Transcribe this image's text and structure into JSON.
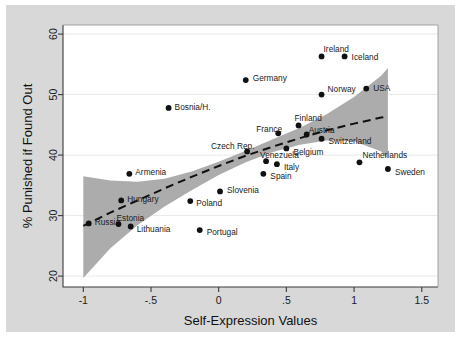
{
  "chart_data": {
    "type": "scatter",
    "title": "",
    "xlabel": "Self-Expression Values",
    "ylabel": "% Punished if Found Out",
    "xlim": [
      -1.15,
      1.62
    ],
    "ylim": [
      18.2,
      61.5
    ],
    "xticks": [
      "-1",
      "-.5",
      "0",
      ".5",
      "1",
      "1.5"
    ],
    "xtick_values": [
      -1,
      -0.5,
      0,
      0.5,
      1,
      1.5
    ],
    "yticks": [
      "20",
      "30",
      "40",
      "50",
      "60"
    ],
    "ytick_values": [
      20,
      30,
      40,
      50,
      60
    ],
    "grid": "horizontal",
    "legend": "none",
    "points": [
      {
        "label": "Russia",
        "x": -0.96,
        "y": 28.7,
        "lx": 6,
        "ly": -1
      },
      {
        "label": "Estonia",
        "x": -0.74,
        "y": 28.6,
        "lx": -2,
        "ly": -6
      },
      {
        "label": "Lithuania",
        "x": -0.65,
        "y": 28.2,
        "lx": 6,
        "ly": 3
      },
      {
        "label": "Hungary",
        "x": -0.72,
        "y": 32.5,
        "lx": 6,
        "ly": -1
      },
      {
        "label": "Armenia",
        "x": -0.66,
        "y": 36.9,
        "lx": 6,
        "ly": -2
      },
      {
        "label": "Bosnia/H.",
        "x": -0.37,
        "y": 47.8,
        "lx": 6,
        "ly": -1
      },
      {
        "label": "Poland",
        "x": -0.21,
        "y": 32.4,
        "lx": 6,
        "ly": 2
      },
      {
        "label": "Portugal",
        "x": -0.14,
        "y": 27.6,
        "lx": 7,
        "ly": 2
      },
      {
        "label": "Slovenia",
        "x": 0.01,
        "y": 34.0,
        "lx": 7,
        "ly": -1
      },
      {
        "label": "Germany",
        "x": 0.2,
        "y": 52.4,
        "lx": 7,
        "ly": -2
      },
      {
        "label": "Czech Rep.",
        "x": 0.21,
        "y": 40.6,
        "lx": -36,
        "ly": -5
      },
      {
        "label": "Spain",
        "x": 0.33,
        "y": 36.9,
        "lx": 7,
        "ly": 2
      },
      {
        "label": "Venezuela",
        "x": 0.35,
        "y": 39.0,
        "lx": -6,
        "ly": -6
      },
      {
        "label": "Italy",
        "x": 0.43,
        "y": 38.5,
        "lx": 7,
        "ly": 3
      },
      {
        "label": "France",
        "x": 0.44,
        "y": 43.6,
        "lx": -22,
        "ly": -4
      },
      {
        "label": "Belgium",
        "x": 0.5,
        "y": 41.1,
        "lx": 7,
        "ly": 4
      },
      {
        "label": "Finland",
        "x": 0.59,
        "y": 44.9,
        "lx": -4,
        "ly": -7
      },
      {
        "label": "Austria",
        "x": 0.65,
        "y": 43.4,
        "lx": 2,
        "ly": -5
      },
      {
        "label": "Switzerland",
        "x": 0.76,
        "y": 42.7,
        "lx": 7,
        "ly": 2
      },
      {
        "label": "Norway",
        "x": 0.76,
        "y": 50.0,
        "lx": 6,
        "ly": -6
      },
      {
        "label": "Ireland",
        "x": 0.76,
        "y": 56.3,
        "lx": 2,
        "ly": -7
      },
      {
        "label": "Iceland",
        "x": 0.93,
        "y": 56.3,
        "lx": 7,
        "ly": 1
      },
      {
        "label": "Netherlands",
        "x": 1.04,
        "y": 38.8,
        "lx": 3,
        "ly": -7
      },
      {
        "label": "USA",
        "x": 1.09,
        "y": 51.0,
        "lx": 7,
        "ly": -1
      },
      {
        "label": "Sweden",
        "x": 1.25,
        "y": 37.7,
        "lx": 7,
        "ly": 3
      }
    ],
    "fit_line": {
      "style": "dashed",
      "x": [
        -1.0,
        -0.8,
        -0.6,
        -0.4,
        -0.2,
        0.0,
        0.2,
        0.4,
        0.6,
        0.8,
        1.0,
        1.2,
        1.25
      ],
      "y": [
        28.3,
        30.5,
        32.5,
        34.5,
        36.4,
        38.2,
        39.9,
        41.4,
        42.8,
        44.1,
        45.2,
        46.2,
        46.4
      ]
    },
    "confidence_band": {
      "fill": "#a8a8a8",
      "x": [
        -1.0,
        -0.8,
        -0.6,
        -0.4,
        -0.2,
        0.0,
        0.2,
        0.4,
        0.6,
        0.8,
        1.0,
        1.2,
        1.25
      ],
      "upper": [
        36.5,
        35.8,
        35.6,
        36.1,
        37.3,
        38.9,
        40.7,
        42.6,
        44.5,
        46.8,
        49.6,
        53.1,
        54.4
      ],
      "lower": [
        19.7,
        24.6,
        28.4,
        31.5,
        34.2,
        36.7,
        38.8,
        40.5,
        41.7,
        42.4,
        42.3,
        40.6,
        39.4
      ]
    }
  },
  "colors": {
    "figure_background": "#d8d8d8",
    "plot_background": "#ffffff",
    "band": "#a8a8a8",
    "marker": "#111111",
    "axis": "#3a3a3a",
    "grid": "#e9e9e9"
  }
}
